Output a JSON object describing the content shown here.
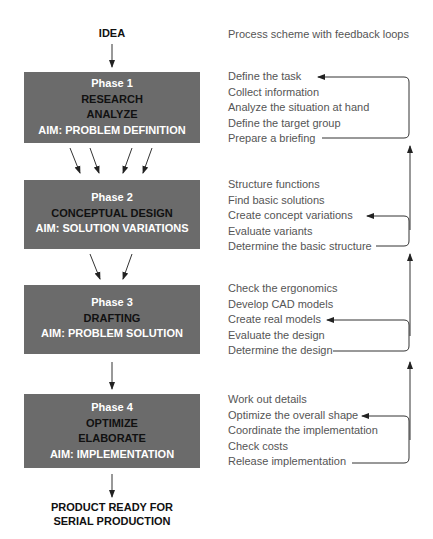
{
  "start": {
    "label": "IDEA"
  },
  "caption": "Process scheme with feedback loops",
  "phases": [
    {
      "phase": "Phase 1",
      "tasks": [
        "RESEARCH",
        "ANALYZE"
      ],
      "aim": "AIM: PROBLEM DEFINITION",
      "steps": [
        "Define the task",
        "Collect information",
        "Analyze the situation at hand",
        "Define the target group",
        "Prepare a briefing"
      ],
      "feedback_target_step": 0
    },
    {
      "phase": "Phase 2",
      "tasks": [
        "CONCEPTUAL DESIGN"
      ],
      "aim": "AIM: SOLUTION VARIATIONS",
      "steps": [
        "Structure functions",
        "Find basic solutions",
        "Create concept variations",
        "Evaluate variants",
        "Determine the basic structure"
      ],
      "feedback_target_step": 2
    },
    {
      "phase": "Phase 3",
      "tasks": [
        "DRAFTING"
      ],
      "aim": "AIM: PROBLEM SOLUTION",
      "steps": [
        "Check the ergonomics",
        "Develop CAD models",
        "Create real models",
        "Evaluate the design",
        "Determine the design"
      ],
      "feedback_target_step": 2
    },
    {
      "phase": "Phase 4",
      "tasks": [
        "OPTIMIZE",
        "ELABORATE"
      ],
      "aim": "AIM: IMPLEMENTATION",
      "steps": [
        "Work out details",
        "Optimize the overall shape",
        "Coordinate the implementation",
        "Check costs",
        "Release implementation"
      ],
      "feedback_target_step": 1
    }
  ],
  "end": {
    "line1": "PRODUCT READY FOR",
    "line2": "SERIAL PRODUCTION"
  },
  "colors": {
    "box": "#6b6b6b",
    "box_title": "#ffffff",
    "box_task": "#111111",
    "text": "#555555",
    "line": "#333333"
  }
}
